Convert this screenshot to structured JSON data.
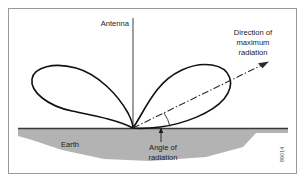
{
  "figure": {
    "labels": {
      "antenna": "Antenna",
      "earth": "Earth",
      "direction_line_1": "Direction of",
      "direction_line_2": "maximum",
      "direction_line_3": "radiation",
      "angle_line_1": "Angle of",
      "angle_line_2": "radiation",
      "figure_id": "89014"
    },
    "colors": {
      "border": "#9a9a9a",
      "earth_fill": "#b3b3b3",
      "lobe_stroke": "#111111",
      "ground_line": "#3a3a3a",
      "antenna_line": "#4f4f4f",
      "arrow_line": "#2b2b2b",
      "text": "#1b1b1b",
      "background": "#ffffff"
    },
    "geometry": {
      "origin_x": 133,
      "origin_y": 128,
      "antenna_top_y": 18,
      "ground_y": 128,
      "ground_left_x": 18,
      "ground_right_x": 288,
      "arrow_tip_x": 268,
      "arrow_tip_y": 61,
      "angle_of_radiation_degrees": 28
    }
  }
}
